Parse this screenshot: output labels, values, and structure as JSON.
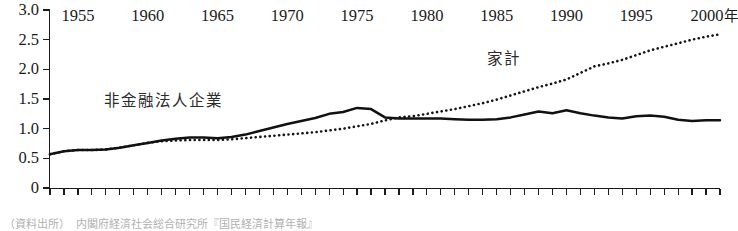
{
  "chart_data": {
    "type": "line",
    "title": "",
    "xlabel": "年",
    "ylabel": "",
    "ylim": [
      0,
      3.0
    ],
    "xlim": [
      1953,
      2001
    ],
    "grid": false,
    "legend_position": "inline-annotation",
    "y_ticks": [
      "0",
      "0.5",
      "1.0",
      "1.5",
      "2.0",
      "2.5",
      "3.0"
    ],
    "y_tick_values": [
      0,
      0.5,
      1.0,
      1.5,
      2.0,
      2.5,
      3.0
    ],
    "x_tick_labels": [
      "1955",
      "1960",
      "1965",
      "1970",
      "1975",
      "1980",
      "1985",
      "1990",
      "1995",
      "2000"
    ],
    "x_tick_values": [
      1955,
      1960,
      1965,
      1970,
      1975,
      1980,
      1985,
      1990,
      1995,
      2000
    ],
    "x_axis_unit": "年",
    "x_minor_interval": 1,
    "x": [
      1953,
      1954,
      1955,
      1956,
      1957,
      1958,
      1959,
      1960,
      1961,
      1962,
      1963,
      1964,
      1965,
      1966,
      1967,
      1968,
      1969,
      1970,
      1971,
      1972,
      1973,
      1974,
      1975,
      1976,
      1977,
      1978,
      1979,
      1980,
      1981,
      1982,
      1983,
      1984,
      1985,
      1986,
      1987,
      1988,
      1989,
      1990,
      1991,
      1992,
      1993,
      1994,
      1995,
      1996,
      1997,
      1998,
      1999,
      2000,
      2001
    ],
    "series": [
      {
        "name": "非金融法人企業",
        "style": "solid",
        "color": "#111111",
        "values": [
          0.57,
          0.62,
          0.64,
          0.64,
          0.65,
          0.68,
          0.72,
          0.76,
          0.8,
          0.83,
          0.85,
          0.85,
          0.84,
          0.86,
          0.9,
          0.96,
          1.02,
          1.08,
          1.13,
          1.18,
          1.25,
          1.28,
          1.35,
          1.33,
          1.19,
          1.17,
          1.17,
          1.17,
          1.17,
          1.16,
          1.15,
          1.15,
          1.16,
          1.19,
          1.24,
          1.29,
          1.26,
          1.31,
          1.26,
          1.22,
          1.19,
          1.17,
          1.21,
          1.22,
          1.2,
          1.15,
          1.13,
          1.14,
          1.14
        ]
      },
      {
        "name": "家計",
        "style": "dotted",
        "color": "#151515",
        "values": [
          0.57,
          0.62,
          0.64,
          0.64,
          0.65,
          0.68,
          0.72,
          0.76,
          0.79,
          0.8,
          0.81,
          0.81,
          0.81,
          0.82,
          0.84,
          0.86,
          0.88,
          0.9,
          0.92,
          0.94,
          0.97,
          1.0,
          1.04,
          1.08,
          1.14,
          1.19,
          1.21,
          1.25,
          1.29,
          1.33,
          1.38,
          1.43,
          1.49,
          1.56,
          1.63,
          1.7,
          1.76,
          1.83,
          1.94,
          2.05,
          2.1,
          2.16,
          2.24,
          2.32,
          2.38,
          2.44,
          2.5,
          2.55,
          2.59
        ]
      }
    ],
    "annotations": [
      {
        "name": "非金融法人企業",
        "x": 1962,
        "y": 1.45
      },
      {
        "name": "家計",
        "x": 1988,
        "y": 2.2
      }
    ]
  },
  "labels": {
    "series_corp": "非金融法人企業",
    "series_household": "家計",
    "x_unit": "年"
  },
  "footnote": {
    "text": "（資料出所）　内閣府経済社会総合研究所『国民経済計算年報』"
  },
  "y_axis": {
    "ticks": [
      "3.0",
      "2.5",
      "2.0",
      "1.5",
      "1.0",
      "0.5",
      "0"
    ]
  },
  "x_axis": {
    "labels": [
      "1955",
      "1960",
      "1965",
      "1970",
      "1975",
      "1980",
      "1985",
      "1990",
      "1995",
      "2000"
    ]
  },
  "colors": {
    "axis": "#1b1b1b",
    "solid_line": "#111111",
    "dotted_line": "#151515",
    "text": "#1a1a1a",
    "background": "#ffffff"
  }
}
